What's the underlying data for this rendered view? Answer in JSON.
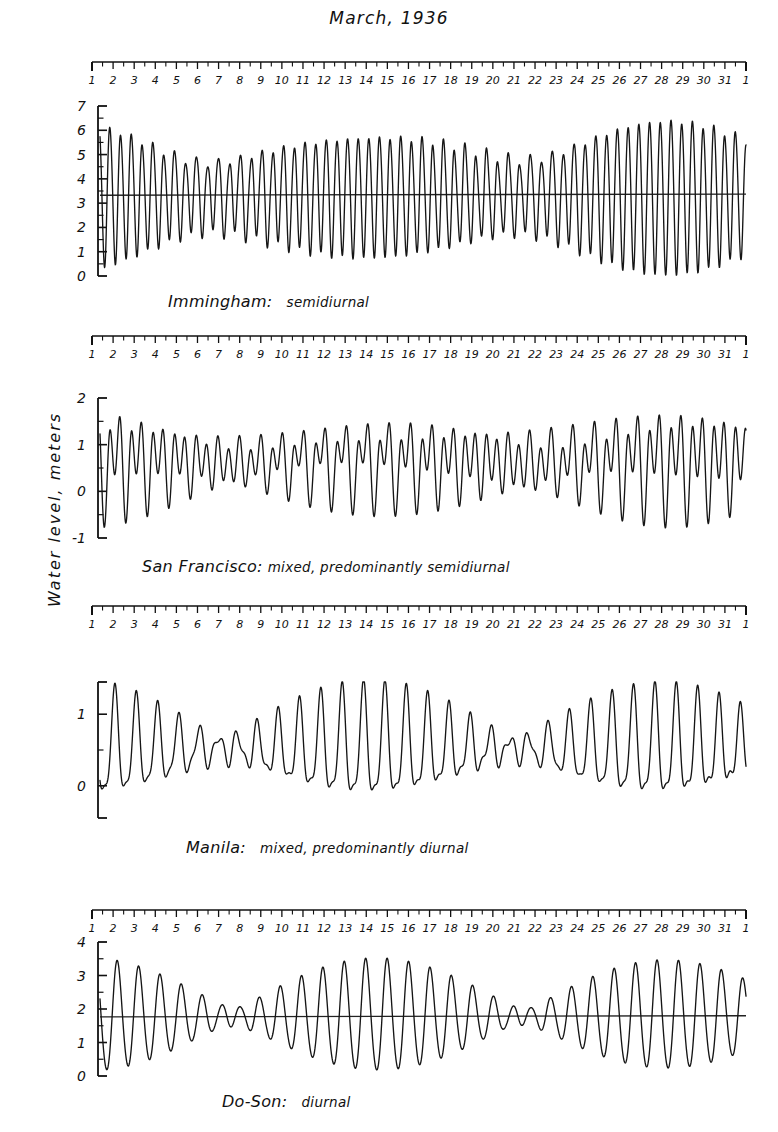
{
  "title": "March, 1936",
  "axis_title": "Water level, meters",
  "day_labels": [
    "1",
    "2",
    "3",
    "4",
    "5",
    "6",
    "7",
    "8",
    "9",
    "10",
    "11",
    "12",
    "13",
    "14",
    "15",
    "16",
    "17",
    "18",
    "19",
    "20",
    "21",
    "22",
    "23",
    "24",
    "25",
    "26",
    "27",
    "28",
    "29",
    "30",
    "31",
    "1"
  ],
  "colors": {
    "ink": "#111111",
    "background": "#ffffff",
    "trace": "#151515",
    "datum": "#222222"
  },
  "panels": [
    {
      "name": "immingham",
      "place": "Immingham:",
      "kind": "semidiurnal",
      "y_labels": [
        "7",
        "6",
        "5",
        "4",
        "3",
        "2",
        "1",
        "0"
      ],
      "y_values": [
        7,
        6,
        5,
        4,
        3,
        2,
        1,
        0
      ],
      "ylim": [
        0,
        7
      ],
      "minor_ticks": true,
      "datum": 3.35,
      "show_datum": true
    },
    {
      "name": "san-francisco",
      "place": "San Francisco:",
      "kind": "mixed, predominantly semidiurnal",
      "y_labels": [
        "2",
        "1",
        "0",
        "-1"
      ],
      "y_values": [
        2,
        1,
        0,
        -1
      ],
      "ylim": [
        -1,
        2
      ],
      "minor_ticks": true,
      "datum": 0,
      "show_datum": false
    },
    {
      "name": "manila",
      "place": "Manila:",
      "kind": "mixed, predominantly diurnal",
      "y_labels": [
        "1",
        "0"
      ],
      "y_values": [
        1,
        0
      ],
      "ylim": [
        -0.45,
        1.45
      ],
      "minor_ticks": true,
      "datum": 0,
      "show_datum": false
    },
    {
      "name": "do-son",
      "place": "Do-Son:",
      "kind": "diurnal",
      "y_labels": [
        "4",
        "3",
        "2",
        "1",
        "0"
      ],
      "y_values": [
        4,
        3,
        2,
        1,
        0
      ],
      "ylim": [
        0,
        4
      ],
      "minor_ticks": true,
      "datum": 1.78,
      "show_datum": true
    }
  ],
  "chart_data": {
    "type": "line",
    "title": "March, 1936",
    "xlabel": "Day of month",
    "ylabel": "Water level, meters",
    "xlim": [
      1,
      32
    ],
    "x_tick_labels": [
      "1",
      "2",
      "3",
      "4",
      "5",
      "6",
      "7",
      "8",
      "9",
      "10",
      "11",
      "12",
      "13",
      "14",
      "15",
      "16",
      "17",
      "18",
      "19",
      "20",
      "21",
      "22",
      "23",
      "24",
      "25",
      "26",
      "27",
      "28",
      "29",
      "30",
      "31",
      "1"
    ],
    "grid": false,
    "legend": "none",
    "note": "Four tide-gauge records for March 1936 illustrating the four tidal regimes. Each trace is reconstructed from the harmonic constituents listed below; amplitudes in meters, periods in hours, phases in degrees.",
    "series": [
      {
        "name": "Immingham",
        "regime": "semidiurnal",
        "ylim": [
          0,
          7
        ],
        "mean_level": 3.35,
        "samples_per_day": 64,
        "constituents": [
          {
            "symbol": "M2",
            "period_hours": 12.4206,
            "amplitude": 2.12,
            "phase_deg": 20
          },
          {
            "symbol": "S2",
            "period_hours": 12.0,
            "amplitude": 0.7,
            "phase_deg": 70
          },
          {
            "symbol": "N2",
            "period_hours": 12.6583,
            "amplitude": 0.36,
            "phase_deg": 0
          },
          {
            "symbol": "K1",
            "period_hours": 23.9345,
            "amplitude": 0.14,
            "phase_deg": 150
          },
          {
            "symbol": "O1",
            "period_hours": 25.8193,
            "amplitude": 0.11,
            "phase_deg": 310
          },
          {
            "symbol": "M4",
            "period_hours": 6.2103,
            "amplitude": 0.16,
            "phase_deg": 200
          }
        ],
        "spring_days": [
          2,
          11,
          26
        ],
        "neap_days": [
          7,
          19
        ],
        "approx_range_spring": 6.4,
        "approx_range_neap": 2.6
      },
      {
        "name": "San Francisco",
        "regime": "mixed, predominantly semidiurnal",
        "ylim": [
          -1,
          2
        ],
        "mean_level": 0.62,
        "samples_per_day": 64,
        "constituents": [
          {
            "symbol": "M2",
            "period_hours": 12.4206,
            "amplitude": 0.58,
            "phase_deg": 40
          },
          {
            "symbol": "S2",
            "period_hours": 12.0,
            "amplitude": 0.14,
            "phase_deg": 60
          },
          {
            "symbol": "K1",
            "period_hours": 23.9345,
            "amplitude": 0.37,
            "phase_deg": 100
          },
          {
            "symbol": "O1",
            "period_hours": 25.8193,
            "amplitude": 0.23,
            "phase_deg": 80
          },
          {
            "symbol": "N2",
            "period_hours": 12.6583,
            "amplitude": 0.13,
            "phase_deg": 20
          }
        ],
        "approx_high": 1.55,
        "approx_low": -0.35
      },
      {
        "name": "Manila",
        "regime": "mixed, predominantly diurnal",
        "ylim": [
          -0.45,
          1.45
        ],
        "mean_level": 0.52,
        "samples_per_day": 64,
        "constituents": [
          {
            "symbol": "K1",
            "period_hours": 23.9345,
            "amplitude": 0.36,
            "phase_deg": 120
          },
          {
            "symbol": "O1",
            "period_hours": 25.8193,
            "amplitude": 0.29,
            "phase_deg": 95
          },
          {
            "symbol": "M2",
            "period_hours": 12.4206,
            "amplitude": 0.16,
            "phase_deg": 200
          },
          {
            "symbol": "S2",
            "period_hours": 12.0,
            "amplitude": 0.07,
            "phase_deg": 240
          },
          {
            "symbol": "P1",
            "period_hours": 24.0659,
            "amplitude": 0.11,
            "phase_deg": 120
          }
        ],
        "tropic_days": [
          1,
          4,
          28,
          31
        ],
        "equatorial_days": [
          14,
          17
        ],
        "approx_high": 1.15,
        "approx_low": -0.05
      },
      {
        "name": "Do-Son",
        "regime": "diurnal",
        "ylim": [
          0,
          4
        ],
        "mean_level": 1.78,
        "samples_per_day": 64,
        "constituents": [
          {
            "symbol": "K1",
            "period_hours": 23.9345,
            "amplitude": 0.75,
            "phase_deg": 75
          },
          {
            "symbol": "O1",
            "period_hours": 25.8193,
            "amplitude": 0.7,
            "phase_deg": 60
          },
          {
            "symbol": "P1",
            "period_hours": 24.0659,
            "amplitude": 0.24,
            "phase_deg": 75
          },
          {
            "symbol": "M2",
            "period_hours": 12.4206,
            "amplitude": 0.06,
            "phase_deg": 160
          },
          {
            "symbol": "S2",
            "period_hours": 12.0,
            "amplitude": 0.03,
            "phase_deg": 200
          }
        ],
        "tropic_days": [
          2,
          29
        ],
        "equatorial_days": [
          15,
          16
        ],
        "approx_high": 3.2,
        "approx_low": 0.35
      }
    ]
  }
}
